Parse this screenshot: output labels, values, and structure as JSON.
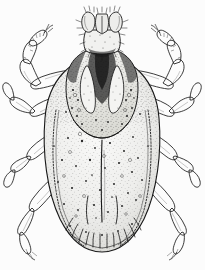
{
  "figure": {
    "type": "scientific-illustration",
    "technique": "pen-and-ink stipple line drawing",
    "background_color": "#ffffff",
    "ink_color": "#1a1a1a",
    "midtone_color": "#7a7a7a",
    "light_fill_color": "#f2f2f0",
    "caption": "",
    "title": "",
    "canvas": {
      "width": 205,
      "height": 270
    }
  },
  "anatomy": {
    "capitulum": {
      "label": "capitulum",
      "center_x": 102,
      "center_y": 33,
      "parts": [
        "palps",
        "hypostome",
        "basis capituli"
      ]
    },
    "scutum": {
      "label": "scutum",
      "center_x": 102,
      "center_y": 85,
      "markings": "dark cervical grooves and scapular shading"
    },
    "idiosoma": {
      "label": "idiosoma",
      "center_x": 102,
      "center_y": 155,
      "width": 112,
      "height": 175,
      "surface": "dense stippling with scattered punctations"
    },
    "festoons": {
      "label": "festoons",
      "count": 11,
      "center_y": 243
    },
    "marginal_groove": {
      "label": "marginal groove",
      "style": "beaded dashed line"
    },
    "legs": {
      "label": "legs",
      "count": 8,
      "pairs": 4,
      "segments": [
        "coxa",
        "trochanter",
        "femur",
        "genu",
        "tibia",
        "tarsus",
        "claw"
      ]
    }
  },
  "stipple": {
    "body_dots": 520,
    "punctation_dots": 150,
    "dot_color": "#2b2b2b"
  }
}
